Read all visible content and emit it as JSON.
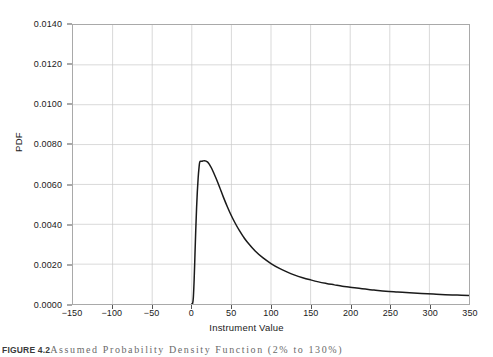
{
  "figure": {
    "caption_label": "FIGURE 4.2",
    "caption_text": "Assumed Probability Density Function (2% to 130%)"
  },
  "chart_data": {
    "type": "line",
    "title": "",
    "subtitle": "",
    "xlabel": "Instrument Value",
    "ylabel": "PDF",
    "xlim": [
      -150,
      350
    ],
    "ylim": [
      0.0,
      0.014
    ],
    "grid": true,
    "legend": "none",
    "xticks": [
      -150,
      -100,
      -50,
      0,
      50,
      100,
      150,
      200,
      250,
      300,
      350
    ],
    "xtick_labels": [
      "−150",
      "−100",
      "−50",
      "0",
      "50",
      "100",
      "150",
      "200",
      "250",
      "300",
      "350"
    ],
    "yticks": [
      0.0,
      0.002,
      0.004,
      0.006,
      0.008,
      0.01,
      0.012,
      0.014
    ],
    "ytick_labels": [
      "0.0000",
      "0.0020",
      "0.0040",
      "0.0060",
      "0.0080",
      "0.0100",
      "0.0120",
      "0.0140"
    ],
    "series": [
      {
        "name": "PDF",
        "color": "#1a1a1a",
        "x": [
          0,
          1,
          2,
          3,
          4,
          5,
          6,
          7,
          8,
          9,
          10,
          12,
          14,
          16,
          18,
          20,
          22,
          25,
          28,
          31,
          35,
          40,
          45,
          50,
          55,
          60,
          65,
          70,
          80,
          90,
          100,
          110,
          120,
          130,
          140,
          150,
          160,
          170,
          180,
          190,
          200,
          215,
          230,
          245,
          260,
          275,
          290,
          305,
          320,
          335,
          350
        ],
        "values": [
          0.0,
          2e-05,
          0.00035,
          0.00125,
          0.00248,
          0.00372,
          0.00479,
          0.00565,
          0.00631,
          0.00679,
          0.00712,
          0.00716,
          0.00718,
          0.00719,
          0.00717,
          0.00712,
          0.00702,
          0.00681,
          0.00655,
          0.00627,
          0.00587,
          0.00535,
          0.00487,
          0.00443,
          0.00404,
          0.00369,
          0.00338,
          0.00311,
          0.00266,
          0.00231,
          0.00203,
          0.0018,
          0.00161,
          0.00145,
          0.00132,
          0.00121,
          0.00111,
          0.00103,
          0.00096,
          0.00089,
          0.00084,
          0.00076,
          0.0007,
          0.00064,
          0.0006,
          0.00056,
          0.00053,
          0.0005,
          0.00047,
          0.00045,
          0.00043
        ]
      }
    ],
    "annotations": {
      "peak_x": 16,
      "peak_y": 0.00719,
      "curve_start_x": 0,
      "curve_end_x": 350
    },
    "colors": {
      "curve": "#1a1a1a",
      "grid": "#c8c8c8",
      "frame": "#a9a9a9",
      "text": "#1a1a1a"
    }
  }
}
